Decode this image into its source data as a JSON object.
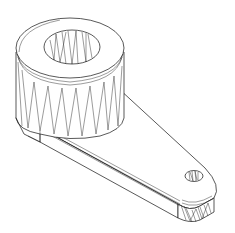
{
  "drawing": {
    "title": "Servo horn / lever arm (isometric wireframe)",
    "style": "black line art on white",
    "colors": {
      "background": "#ffffff",
      "line": "#111111"
    },
    "parts": [
      {
        "name": "hub-cylinder",
        "description": "large cylindrical boss with central bore, faceted sides"
      },
      {
        "name": "central-bore",
        "description": "through-hole in hub with faceted inner wall"
      },
      {
        "name": "lever-arm",
        "description": "tapered flat arm extending from hub"
      },
      {
        "name": "tip-hole",
        "description": "small hole near rounded arm tip"
      }
    ]
  }
}
